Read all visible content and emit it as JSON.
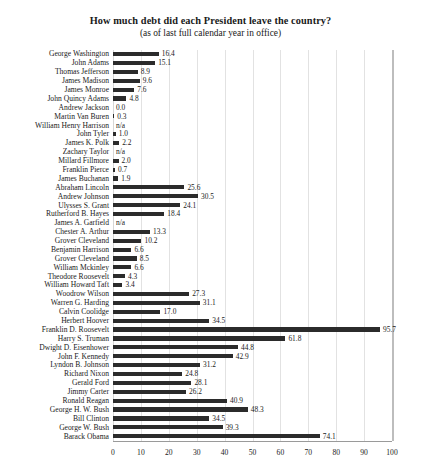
{
  "chart_data": {
    "type": "bar",
    "orientation": "horizontal",
    "title": "How much debt did each President leave the country?",
    "subtitle": "(as of last full calendar year in office)",
    "xlabel": "",
    "ylabel": "",
    "xlim": [
      0,
      100
    ],
    "xticks": [
      0,
      10,
      20,
      30,
      40,
      50,
      60,
      70,
      80,
      90,
      100
    ],
    "grid": true,
    "legend": false,
    "bar_color": "#2b2b2b",
    "gridline_color": "#e2e2e2",
    "categories": [
      "George Washington",
      "John Adams",
      "Thomas Jefferson",
      "James Madison",
      "James Monroe",
      "John Quincy Adams",
      "Andrew Jackson",
      "Martin Van Buren",
      "William Henry Harrison",
      "John Tyler",
      "James K. Polk",
      "Zachary Taylor",
      "Millard Fillmore",
      "Franklin Pierce",
      "James Buchanan",
      "Abraham Lincoln",
      "Andrew Johnson",
      "Ulysses S. Grant",
      "Rutherford B. Hayes",
      "James A. Garfield",
      "Chester A. Arthur",
      "Grover Cleveland",
      "Benjamin Harrison",
      "Grover Cleveland",
      "William Mckinley",
      "Theodore Roosevelt",
      "William Howard Taft",
      "Woodrow Wilson",
      "Warren G. Harding",
      "Calvin Coolidge",
      "Herbert Hoover",
      "Franklin D. Roosevelt",
      "Harry S. Truman",
      "Dwight D. Eisenhower",
      "John F. Kennedy",
      "Lyndon B. Johnson",
      "Richard Nixon",
      "Gerald Ford",
      "Jimmy Carter",
      "Ronald Reagan",
      "George H. W. Bush",
      "Bill Clinton",
      "George W. Bush",
      "Barack Obama"
    ],
    "values": [
      16.4,
      15.1,
      8.9,
      9.6,
      7.6,
      4.8,
      0.0,
      0.3,
      null,
      1.0,
      2.2,
      null,
      2.0,
      0.7,
      1.9,
      25.6,
      30.5,
      24.1,
      18.4,
      null,
      13.3,
      10.2,
      6.6,
      8.5,
      6.6,
      4.3,
      3.4,
      27.3,
      31.1,
      17.0,
      34.5,
      95.7,
      61.8,
      44.8,
      42.9,
      31.2,
      24.8,
      28.1,
      26.2,
      40.9,
      48.3,
      34.5,
      39.3,
      74.1
    ],
    "value_labels": [
      "16.4",
      "15.1",
      "8.9",
      "9.6",
      "7.6",
      "4.8",
      "0.0",
      "0.3",
      "n/a",
      "1.0",
      "2.2",
      "n/a",
      "2.0",
      "0.7",
      "1.9",
      "25.6",
      "30.5",
      "24.1",
      "18.4",
      "n/a",
      "13.3",
      "10.2",
      "6.6",
      "8.5",
      "6.6",
      "4.3",
      "3.4",
      "27.3",
      "31.1",
      "17.0",
      "34.5",
      "95.7",
      "61.8",
      "44.8",
      "42.9",
      "31.2",
      "24.8",
      "28.1",
      "26.2",
      "40.9",
      "48.3",
      "34.5",
      "39.3",
      "74.1"
    ]
  }
}
